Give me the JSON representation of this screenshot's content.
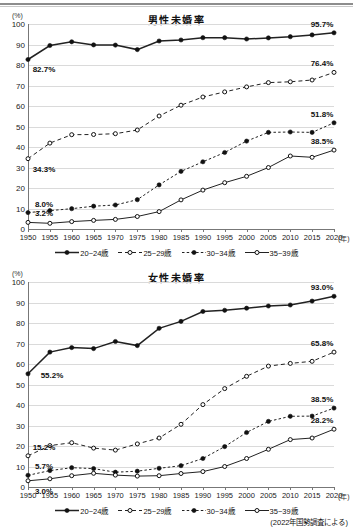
{
  "source_note": "(2022年国勢調査による)",
  "axis": {
    "y_unit": "(%)",
    "x_unit": "(年)",
    "y_ticks": [
      0,
      10,
      20,
      30,
      40,
      50,
      60,
      70,
      80,
      90,
      100
    ],
    "x_ticks": [
      1950,
      1955,
      1960,
      1965,
      1970,
      1975,
      1980,
      1985,
      1990,
      1995,
      2000,
      2005,
      2010,
      2015,
      2020
    ]
  },
  "legend": [
    {
      "label": "20~24歳",
      "marker": "filled",
      "line": "solid"
    },
    {
      "label": "25~29歳",
      "marker": "open",
      "line": "dashed"
    },
    {
      "label": "30~34歳",
      "marker": "filled",
      "line": "dotted"
    },
    {
      "label": "35~39歳",
      "marker": "open",
      "line": "solid"
    }
  ],
  "chart_data": [
    {
      "type": "line",
      "title": "男性未婚率",
      "xlabel": "(年)",
      "ylabel": "(%)",
      "ylim": [
        0,
        100
      ],
      "xlim": [
        1950,
        2020
      ],
      "grid": true,
      "legend_position": "bottom",
      "x": [
        1950,
        1955,
        1960,
        1965,
        1970,
        1975,
        1980,
        1985,
        1990,
        1995,
        2000,
        2005,
        2010,
        2015,
        2020
      ],
      "series": [
        {
          "name": "20~24歳",
          "values": [
            82.7,
            89.5,
            91.3,
            89.8,
            89.7,
            87.5,
            91.7,
            92.2,
            93.3,
            93.3,
            92.7,
            93.2,
            93.8,
            94.7,
            95.7
          ]
        },
        {
          "name": "25~29歳",
          "values": [
            34.3,
            41.9,
            46.0,
            46.1,
            46.5,
            48.3,
            55.1,
            60.4,
            64.4,
            66.9,
            69.3,
            71.4,
            71.8,
            72.7,
            76.4
          ]
        },
        {
          "name": "30~34歳",
          "values": [
            8.0,
            9.0,
            9.9,
            11.1,
            11.7,
            14.3,
            21.5,
            28.1,
            32.8,
            37.3,
            42.9,
            47.1,
            47.3,
            47.1,
            51.8
          ]
        },
        {
          "name": "35~39歳",
          "values": [
            3.2,
            2.8,
            3.6,
            4.2,
            4.7,
            6.1,
            8.5,
            14.2,
            19.0,
            22.6,
            25.7,
            30.0,
            35.6,
            35.0,
            38.5
          ]
        }
      ],
      "annotations": [
        {
          "text": "82.7%",
          "series": "20~24歳",
          "x": 1950,
          "position": "below"
        },
        {
          "text": "95.7%",
          "series": "20~24歳",
          "x": 2020,
          "position": "above"
        },
        {
          "text": "34.3%",
          "series": "25~29歳",
          "x": 1950,
          "position": "below"
        },
        {
          "text": "76.4%",
          "series": "25~29歳",
          "x": 2020,
          "position": "above"
        },
        {
          "text": "8.0%",
          "series": "30~34歳",
          "x": 1950,
          "position": "above"
        },
        {
          "text": "51.8%",
          "series": "30~34歳",
          "x": 2020,
          "position": "above"
        },
        {
          "text": "3.2%",
          "series": "35~39歳",
          "x": 1950,
          "position": "above"
        },
        {
          "text": "38.5%",
          "series": "35~39歳",
          "x": 2020,
          "position": "above"
        }
      ]
    },
    {
      "type": "line",
      "title": "女性未婚率",
      "xlabel": "(年)",
      "ylabel": "(%)",
      "ylim": [
        0,
        100
      ],
      "xlim": [
        1950,
        2020
      ],
      "grid": true,
      "legend_position": "bottom",
      "x": [
        1950,
        1955,
        1960,
        1965,
        1970,
        1975,
        1980,
        1985,
        1990,
        1995,
        2000,
        2005,
        2010,
        2015,
        2020
      ],
      "series": [
        {
          "name": "20~24歳",
          "values": [
            55.2,
            65.8,
            68.0,
            67.5,
            71.0,
            69.0,
            77.4,
            80.8,
            85.6,
            86.2,
            87.2,
            88.3,
            88.8,
            90.7,
            93.0
          ]
        },
        {
          "name": "25~29歳",
          "values": [
            15.2,
            20.2,
            21.6,
            19.0,
            18.0,
            21.0,
            23.9,
            30.6,
            40.2,
            48.0,
            54.0,
            59.0,
            60.3,
            61.3,
            65.8
          ]
        },
        {
          "name": "30~34歳",
          "values": [
            5.7,
            8.0,
            9.4,
            9.0,
            7.2,
            7.7,
            9.1,
            10.4,
            13.9,
            19.7,
            26.6,
            32.0,
            34.5,
            34.6,
            38.5
          ]
        },
        {
          "name": "35~39歳",
          "values": [
            3.0,
            4.0,
            5.5,
            6.7,
            5.8,
            5.3,
            5.5,
            6.6,
            7.5,
            10.0,
            13.9,
            18.4,
            23.1,
            23.9,
            28.2
          ]
        }
      ],
      "annotations": [
        {
          "text": "55.2%",
          "series": "20~24歳",
          "x": 1950,
          "position": "right"
        },
        {
          "text": "93.0%",
          "series": "20~24歳",
          "x": 2020,
          "position": "above"
        },
        {
          "text": "15.2%",
          "series": "25~29歳",
          "x": 1950,
          "position": "above"
        },
        {
          "text": "65.8%",
          "series": "25~29歳",
          "x": 2020,
          "position": "above"
        },
        {
          "text": "5.7%",
          "series": "30~34歳",
          "x": 1950,
          "position": "above"
        },
        {
          "text": "38.5%",
          "series": "30~34歳",
          "x": 2020,
          "position": "above"
        },
        {
          "text": "3.0%",
          "series": "35~39歳",
          "x": 1950,
          "position": "below"
        },
        {
          "text": "28.2%",
          "series": "35~39歳",
          "x": 2020,
          "position": "above"
        }
      ]
    }
  ]
}
